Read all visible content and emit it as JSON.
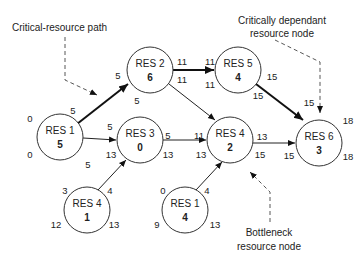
{
  "diagram": {
    "type": "resource-network",
    "annotations": {
      "critical_path": "Critical-resource path",
      "critically_dependent_line1": "Critically dependant",
      "critically_dependent_line2": "resource node",
      "bottleneck_line1": "Bottleneck",
      "bottleneck_line2": "resource node"
    },
    "nodes": [
      {
        "id": "n1",
        "name": "RES 1",
        "value": "5",
        "tl": "0",
        "tr": "5",
        "bl": "0",
        "br": "5"
      },
      {
        "id": "n2",
        "name": "RES 2",
        "value": "6",
        "tl": "5",
        "tr": "11",
        "bl": "5",
        "br": "11"
      },
      {
        "id": "n3",
        "name": "RES 3",
        "value": "0",
        "tl": "5",
        "tr": "5",
        "bl": "13",
        "br": "13"
      },
      {
        "id": "n5",
        "name": "RES 5",
        "value": "4",
        "tl": "11",
        "tr": "15",
        "bl": "11",
        "br": "15"
      },
      {
        "id": "n4",
        "name": "RES 4",
        "value": "2",
        "tl": "11",
        "tr": "13",
        "bl": "13",
        "br": "15"
      },
      {
        "id": "n6",
        "name": "RES 6",
        "value": "3",
        "tl": "15",
        "tr": "18",
        "bl": "15",
        "br": "18"
      },
      {
        "id": "n4b",
        "name": "RES 4",
        "value": "1",
        "tl": "3",
        "tr": "4",
        "bl": "12",
        "br": "13"
      },
      {
        "id": "n1b",
        "name": "RES 1",
        "value": "4",
        "tl": "0",
        "tr": "4",
        "bl": "9",
        "br": "13"
      }
    ],
    "edges": [
      {
        "from": "RES 1",
        "to": "RES 2",
        "critical": true
      },
      {
        "from": "RES 1",
        "to": "RES 3",
        "critical": false
      },
      {
        "from": "RES 2",
        "to": "RES 5",
        "critical": true
      },
      {
        "from": "RES 2",
        "to": "RES 4",
        "critical": false
      },
      {
        "from": "RES 3",
        "to": "RES 4",
        "critical": false
      },
      {
        "from": "RES 5",
        "to": "RES 6",
        "critical": true
      },
      {
        "from": "RES 4",
        "to": "RES 6",
        "critical": false
      },
      {
        "from": "RES 4 (1)",
        "to": "RES 3",
        "critical": false
      },
      {
        "from": "RES 1 (4)",
        "to": "RES 4",
        "critical": false
      }
    ]
  }
}
